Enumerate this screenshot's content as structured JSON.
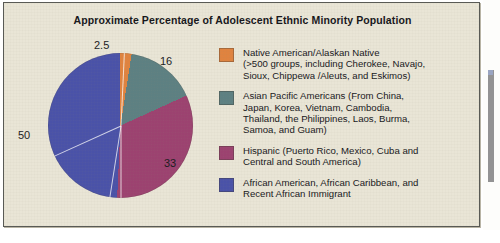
{
  "figure": {
    "title": "Approximate Percentage of Adolescent Ethnic Minority Population",
    "background_color": "#e9e5d6",
    "border_color": "#595a55"
  },
  "chart_data": {
    "type": "pie",
    "title": "Approximate Percentage of Adolescent Ethnic Minority Population",
    "xlabel": "",
    "ylabel": "",
    "legend_position": "right",
    "grid": false,
    "start_angle_deg": 0,
    "direction": "clockwise",
    "categories": [
      "Native American/Alaskan Native",
      "Asian Pacific Americans",
      "Hispanic",
      "African American, African Caribbean, and Recent African Immigrant"
    ],
    "values": [
      2.5,
      16,
      33,
      50
    ],
    "data_labels": [
      "2.5",
      "16",
      "33",
      "50"
    ],
    "colors": [
      "#e0833f",
      "#5d8082",
      "#9c4270",
      "#4a52a8"
    ],
    "slices": [
      {
        "label": "Native American/Alaskan Native",
        "value": 2.5,
        "data_label": "2.5",
        "color": "#e0833f"
      },
      {
        "label": "Asian Pacific Americans",
        "value": 16,
        "data_label": "16",
        "color": "#5d8082"
      },
      {
        "label": "Hispanic",
        "value": 33,
        "data_label": "33",
        "color": "#9c4270"
      },
      {
        "label": "African American, African Caribbean, and Recent African Immigrant",
        "value": 50,
        "data_label": "50",
        "color": "#4a52a8"
      }
    ]
  },
  "legend": {
    "items": [
      {
        "color": "#e0833f",
        "text": "Native American/Alaskan Native\n(>500 groups, including Cherokee, Navajo,\nSioux, Chippewa /Aleuts, and Eskimos)"
      },
      {
        "color": "#5d8082",
        "text": "Asian Pacific Americans (From China,\nJapan, Korea, Vietnam, Cambodia,\nThailand, the Philippines, Laos, Burma,\nSamoa, and Guam)"
      },
      {
        "color": "#9c4270",
        "text": "Hispanic (Puerto Rico, Mexico, Cuba and\nCentral and South America)"
      },
      {
        "color": "#4a52a8",
        "text": "African American, African Caribbean, and\nRecent African Immigrant"
      }
    ]
  }
}
